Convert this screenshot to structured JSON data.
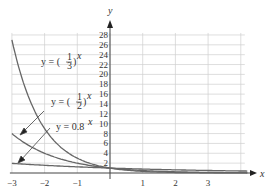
{
  "chart_data": {
    "type": "line",
    "title": "",
    "xlabel": "x",
    "ylabel": "y",
    "xlim": [
      -3,
      4
    ],
    "ylim": [
      0,
      29
    ],
    "x_ticks": [
      -3,
      -2,
      -1,
      1,
      2,
      3
    ],
    "y_ticks": [
      2,
      4,
      6,
      8,
      10,
      12,
      14,
      16,
      18,
      20,
      22,
      24,
      26,
      28
    ],
    "grid": true,
    "series": [
      {
        "name": "y = (1/3)^x",
        "x": [
          -3,
          -2.5,
          -2,
          -1.5,
          -1,
          -0.5,
          0,
          1,
          2,
          3,
          4
        ],
        "values": [
          27,
          15.59,
          9,
          5.2,
          3,
          1.73,
          1,
          0.333,
          0.111,
          0.037,
          0.012
        ]
      },
      {
        "name": "y = (1/2)^x",
        "x": [
          -3,
          -2.5,
          -2,
          -1.5,
          -1,
          -0.5,
          0,
          1,
          2,
          3,
          4
        ],
        "values": [
          8,
          5.66,
          4,
          2.83,
          2,
          1.41,
          1,
          0.5,
          0.25,
          0.125,
          0.0625
        ]
      },
      {
        "name": "y = 0.8^x",
        "x": [
          -3,
          -2,
          -1,
          0,
          1,
          2,
          3,
          4
        ],
        "values": [
          1.95,
          1.5625,
          1.25,
          1,
          0.8,
          0.64,
          0.512,
          0.41
        ]
      }
    ],
    "annotations": [
      {
        "text": "y = (1/3)^x",
        "points_to": "upper curve"
      },
      {
        "text": "y = (1/2)^x",
        "points_to": "middle curve"
      },
      {
        "text": "y = 0.8^x",
        "points_to": "lower curve"
      }
    ]
  },
  "labels": {
    "x_axis": "x",
    "y_axis": "y",
    "eq1_prefix": "y = (",
    "eq1_num": "1",
    "eq1_den": "3",
    "eq1_suffix": ")",
    "eq1_exp": "x",
    "eq2_prefix": "y = (",
    "eq2_num": "1",
    "eq2_den": "2",
    "eq2_suffix": ")",
    "eq2_exp": "x",
    "eq3_base": "y = 0.8",
    "eq3_exp": "x"
  },
  "colors": {
    "curve": "#666666",
    "grid": "#d0d0d0",
    "axis": "#444444"
  }
}
